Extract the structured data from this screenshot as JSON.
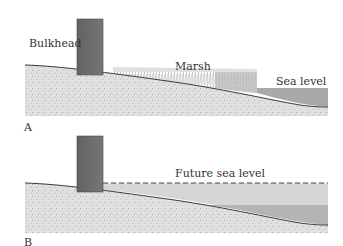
{
  "figure": {
    "panels": [
      {
        "id": "A",
        "letter": "A",
        "labels": {
          "bulkhead": "Bulkhead",
          "marsh": "Marsh",
          "sea_level": "Sea level"
        }
      },
      {
        "id": "B",
        "letter": "B",
        "labels": {
          "future_sea_level": "Future sea level"
        }
      }
    ],
    "colors": {
      "bulkhead": "#6b6b6b",
      "ground": "#dcdcdc",
      "ground_line": "#3a3a3a",
      "marsh_grass": "#bdbdbd",
      "sea_water": "#a9a9a9",
      "future_water_light": "#d6d6d6",
      "future_water_dark": "#b4b4b4",
      "dashed_line": "#444444"
    }
  }
}
